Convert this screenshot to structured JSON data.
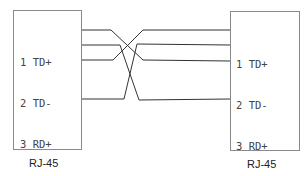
{
  "diagram": {
    "type": "pinout-crossover",
    "connectors": [
      {
        "id": "left",
        "caption": "RJ-45",
        "pins": [
          {
            "num": "1",
            "label": "TD+"
          },
          {
            "num": "2",
            "label": "TD-"
          },
          {
            "num": "3",
            "label": "RD+"
          },
          {
            "num": "4",
            "label": "UNUSED"
          },
          {
            "num": "5",
            "label": "UNUSED"
          },
          {
            "num": "6",
            "label": "RD-"
          },
          {
            "num": "7",
            "label": "UNUSED"
          },
          {
            "num": "8",
            "label": "UNUSED"
          }
        ]
      },
      {
        "id": "right",
        "caption": "RJ-45",
        "pins": [
          {
            "num": "1",
            "label": "TD+"
          },
          {
            "num": "2",
            "label": "TD-"
          },
          {
            "num": "3",
            "label": "RD+"
          },
          {
            "num": "4",
            "label": "UNUSED"
          },
          {
            "num": "5",
            "label": "UNUSED"
          },
          {
            "num": "6",
            "label": "RD-"
          },
          {
            "num": "7",
            "label": "UNUSED"
          },
          {
            "num": "8",
            "label": "UNUSED"
          }
        ]
      }
    ],
    "connections": [
      {
        "from": "1",
        "to": "3"
      },
      {
        "from": "2",
        "to": "6"
      },
      {
        "from": "3",
        "to": "1"
      },
      {
        "from": "6",
        "to": "2"
      }
    ],
    "colors": {
      "wire": "#333333",
      "border": "#8a8a8a",
      "text": "#444444"
    }
  }
}
